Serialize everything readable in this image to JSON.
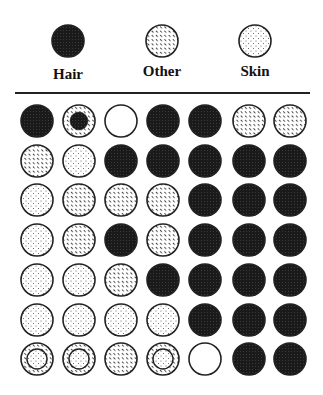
{
  "legend": [
    {
      "key": "hair",
      "label": "Hair"
    },
    {
      "key": "other",
      "label": "Other"
    },
    {
      "key": "skin",
      "label": "Skin"
    }
  ],
  "colors": {
    "hair": "#1a1a1a",
    "outline": "#222222",
    "background": "#ffffff"
  },
  "grid": {
    "rows": [
      [
        "hair",
        "other+hair",
        "empty",
        "hair",
        "hair",
        "other",
        "other"
      ],
      [
        "other",
        "skin",
        "hair",
        "hair",
        "hair",
        "hair",
        "hair"
      ],
      [
        "skin",
        "other",
        "other",
        "other",
        "hair",
        "hair",
        "hair"
      ],
      [
        "skin",
        "other",
        "hair",
        "other",
        "hair",
        "hair",
        "hair"
      ],
      [
        "skin",
        "skin",
        "other",
        "hair",
        "hair",
        "hair",
        "hair"
      ],
      [
        "skin",
        "skin",
        "skin",
        "skin",
        "hair",
        "hair",
        "hair"
      ],
      [
        "other+skin",
        "other+skin",
        "other",
        "other+skin",
        "empty",
        "hair",
        "hair"
      ]
    ]
  }
}
